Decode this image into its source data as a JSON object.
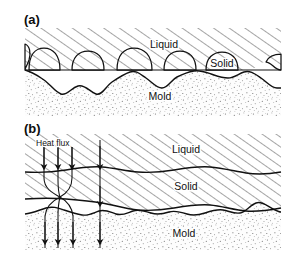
{
  "figure": {
    "background_color": "#ffffff",
    "ink_color": "#111111",
    "width": 289,
    "height": 257
  },
  "panels": [
    {
      "id": "a",
      "label": "(a)",
      "caption_role": "nucleation stage: discrete solid nuclei on rough mold surface",
      "labels": {
        "liquid": "Liquid",
        "solid": "Solid",
        "mold": "Mold"
      },
      "regions": [
        {
          "name": "liquid",
          "fill_style": "diagonal-hatch",
          "label": "Liquid"
        },
        {
          "name": "solid",
          "fill_style": "diagonal-hatch",
          "label": "Solid",
          "shape": "semicircular-nuclei",
          "count": 6
        },
        {
          "name": "mold",
          "fill_style": "stipple",
          "label": "Mold"
        }
      ]
    },
    {
      "id": "b",
      "label": "(b)",
      "caption_role": "growth stage: continuous solid shell with heat flux through contact point",
      "labels": {
        "heat_flux": "Heat flux",
        "liquid": "Liquid",
        "solid": "Solid",
        "mold": "Mold"
      },
      "regions": [
        {
          "name": "liquid",
          "fill_style": "diagonal-hatch",
          "label": "Liquid"
        },
        {
          "name": "solid",
          "fill_style": "diagonal-hatch",
          "label": "Solid"
        },
        {
          "name": "mold",
          "fill_style": "stipple",
          "label": "Mold"
        }
      ],
      "heat_flux": {
        "label": "Heat flux",
        "arrow_count": 4,
        "converging_arrow_count": 3,
        "direction": "downward",
        "note": "three streamlines pinch through a single contact point, one passes straight down"
      }
    }
  ],
  "legend_terms": [
    "Liquid",
    "Solid",
    "Mold",
    "Heat flux"
  ]
}
